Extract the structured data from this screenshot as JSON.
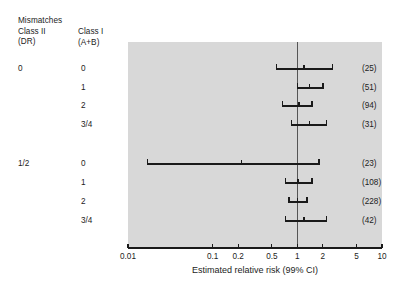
{
  "header": {
    "class2_title": "Mismatches\nClass II\n(DR)",
    "class1_title": "Class I\n(A+B)"
  },
  "groups": [
    {
      "class2_label": "0",
      "rows_start_index": 0
    },
    {
      "class2_label": "1/2",
      "rows_start_index": 4
    }
  ],
  "rows": [
    {
      "class1_label": "0",
      "n": "(25)",
      "rr": 1.2,
      "lo": 0.57,
      "hi": 2.6,
      "group": "0"
    },
    {
      "class1_label": "1",
      "n": "(51)",
      "rr": 1.4,
      "lo": 1.0,
      "hi": 2.0,
      "group": "0"
    },
    {
      "class1_label": "2",
      "n": "(94)",
      "rr": 1.05,
      "lo": 0.67,
      "hi": 1.5,
      "group": "0"
    },
    {
      "class1_label": "3/4",
      "n": "(31)",
      "rr": 1.4,
      "lo": 0.85,
      "hi": 2.2,
      "group": "0"
    },
    {
      "class1_label": "0",
      "n": "(23)",
      "rr": 0.22,
      "lo": 0.017,
      "hi": 1.8,
      "group": "1/2"
    },
    {
      "class1_label": "1",
      "n": "(108)",
      "rr": 1.02,
      "lo": 0.72,
      "hi": 1.5,
      "group": "1/2"
    },
    {
      "class1_label": "2",
      "n": "(228)",
      "rr": 1.0,
      "lo": 0.8,
      "hi": 1.3,
      "group": "1/2"
    },
    {
      "class1_label": "3/4",
      "n": "(42)",
      "rr": 1.2,
      "lo": 0.72,
      "hi": 2.2,
      "group": "1/2"
    }
  ],
  "axis": {
    "title": "Estimated relative risk (99% CI)",
    "ticks": [
      "0.01",
      "0.1",
      "0.2",
      "0.5",
      "1",
      "2",
      "5",
      "10"
    ],
    "tick_values": [
      0.01,
      0.1,
      0.2,
      0.5,
      1,
      2,
      5,
      10
    ],
    "scale": "log",
    "min": 0.01,
    "max": 10,
    "reference_line": 1
  },
  "colors": {
    "panel_background": "#d8d8d8",
    "page_background": "#ffffff",
    "line": "#1a1a1a",
    "text": "#1c1c1c",
    "reference_line": "#555555"
  },
  "chart_data": {
    "type": "forest",
    "title": "",
    "xlabel": "Estimated relative risk (99% CI)",
    "ylabel": "",
    "xscale": "log",
    "xlim": [
      0.01,
      10
    ],
    "xticks": [
      0.01,
      0.1,
      0.2,
      0.5,
      1,
      2,
      5,
      10
    ],
    "xticklabels": [
      "0.01",
      "0.1",
      "0.2",
      "0.5",
      "1",
      "2",
      "5",
      "10"
    ],
    "reference_line": 1,
    "grid": false,
    "legend": "none",
    "group_column_header": "Mismatches Class II (DR)",
    "category_column_header": "Class I (A+B)",
    "count_column_header": "",
    "series": [
      {
        "name": "Class II mismatches = 0",
        "points": [
          {
            "label": "0",
            "n": 25,
            "estimate": 1.2,
            "ci_low": 0.57,
            "ci_high": 2.6
          },
          {
            "label": "1",
            "n": 51,
            "estimate": 1.4,
            "ci_low": 1.0,
            "ci_high": 2.0
          },
          {
            "label": "2",
            "n": 94,
            "estimate": 1.05,
            "ci_low": 0.67,
            "ci_high": 1.5
          },
          {
            "label": "3/4",
            "n": 31,
            "estimate": 1.4,
            "ci_low": 0.85,
            "ci_high": 2.2
          }
        ]
      },
      {
        "name": "Class II mismatches = 1/2",
        "points": [
          {
            "label": "0",
            "n": 23,
            "estimate": 0.22,
            "ci_low": 0.017,
            "ci_high": 1.8
          },
          {
            "label": "1",
            "n": 108,
            "estimate": 1.02,
            "ci_low": 0.72,
            "ci_high": 1.5
          },
          {
            "label": "2",
            "n": 228,
            "estimate": 1.0,
            "ci_low": 0.8,
            "ci_high": 1.3
          },
          {
            "label": "3/4",
            "n": 42,
            "estimate": 1.2,
            "ci_low": 0.72,
            "ci_high": 2.2
          }
        ]
      }
    ]
  }
}
